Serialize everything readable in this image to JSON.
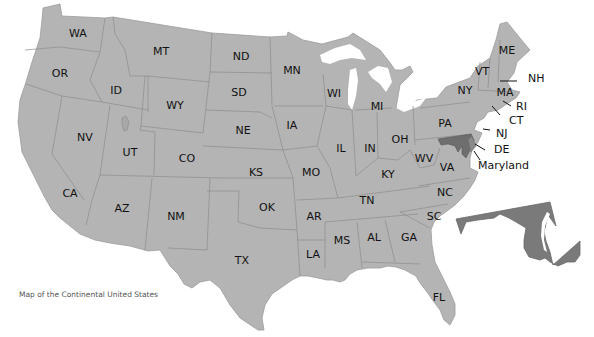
{
  "map": {
    "caption": "Map of the Continental United States",
    "highlighted_state": "Maryland",
    "colors": {
      "state_fill": "#b4b4b4",
      "state_border": "#8a8a8a",
      "highlight_fill": "#7a7a7a",
      "background": "#ffffff",
      "label": "#111111"
    },
    "state_labels": [
      {
        "abbr": "WA",
        "x": 78,
        "y": 33
      },
      {
        "abbr": "OR",
        "x": 60,
        "y": 73
      },
      {
        "abbr": "MT",
        "x": 161,
        "y": 51
      },
      {
        "abbr": "ID",
        "x": 116,
        "y": 90
      },
      {
        "abbr": "WY",
        "x": 175,
        "y": 105
      },
      {
        "abbr": "ND",
        "x": 241,
        "y": 56
      },
      {
        "abbr": "SD",
        "x": 239,
        "y": 92
      },
      {
        "abbr": "NE",
        "x": 243,
        "y": 130
      },
      {
        "abbr": "MN",
        "x": 292,
        "y": 70
      },
      {
        "abbr": "IA",
        "x": 292,
        "y": 125
      },
      {
        "abbr": "WI",
        "x": 334,
        "y": 93
      },
      {
        "abbr": "MI",
        "x": 377,
        "y": 106
      },
      {
        "abbr": "IL",
        "x": 341,
        "y": 148
      },
      {
        "abbr": "IN",
        "x": 370,
        "y": 148
      },
      {
        "abbr": "OH",
        "x": 400,
        "y": 139
      },
      {
        "abbr": "PA",
        "x": 445,
        "y": 123
      },
      {
        "abbr": "NY",
        "x": 465,
        "y": 90
      },
      {
        "abbr": "VT",
        "x": 482,
        "y": 71
      },
      {
        "abbr": "ME",
        "x": 507,
        "y": 50
      },
      {
        "abbr": "MA",
        "x": 505,
        "y": 92
      },
      {
        "abbr": "NV",
        "x": 85,
        "y": 137
      },
      {
        "abbr": "UT",
        "x": 130,
        "y": 152
      },
      {
        "abbr": "CO",
        "x": 187,
        "y": 158
      },
      {
        "abbr": "KS",
        "x": 256,
        "y": 172
      },
      {
        "abbr": "MO",
        "x": 311,
        "y": 172
      },
      {
        "abbr": "KY",
        "x": 388,
        "y": 174
      },
      {
        "abbr": "WV",
        "x": 424,
        "y": 158
      },
      {
        "abbr": "VA",
        "x": 447,
        "y": 167
      },
      {
        "abbr": "CA",
        "x": 70,
        "y": 193
      },
      {
        "abbr": "AZ",
        "x": 122,
        "y": 208
      },
      {
        "abbr": "NM",
        "x": 176,
        "y": 216
      },
      {
        "abbr": "OK",
        "x": 267,
        "y": 207
      },
      {
        "abbr": "AR",
        "x": 314,
        "y": 216
      },
      {
        "abbr": "TN",
        "x": 367,
        "y": 200
      },
      {
        "abbr": "NC",
        "x": 445,
        "y": 192
      },
      {
        "abbr": "SC",
        "x": 434,
        "y": 216
      },
      {
        "abbr": "MS",
        "x": 342,
        "y": 240
      },
      {
        "abbr": "AL",
        "x": 374,
        "y": 237
      },
      {
        "abbr": "GA",
        "x": 409,
        "y": 237
      },
      {
        "abbr": "LA",
        "x": 313,
        "y": 254
      },
      {
        "abbr": "TX",
        "x": 242,
        "y": 260
      },
      {
        "abbr": "FL",
        "x": 439,
        "y": 297
      }
    ],
    "callouts": [
      {
        "abbr": "NH",
        "x": 528,
        "y": 79
      },
      {
        "abbr": "RI",
        "x": 516,
        "y": 107
      },
      {
        "abbr": "CT",
        "x": 509,
        "y": 121
      },
      {
        "abbr": "NJ",
        "x": 496,
        "y": 134
      },
      {
        "abbr": "DE",
        "x": 494,
        "y": 150
      },
      {
        "abbr": "Maryland",
        "x": 478,
        "y": 166
      }
    ]
  }
}
